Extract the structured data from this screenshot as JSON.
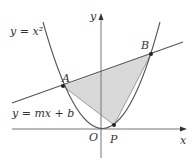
{
  "diagram": {
    "labels": {
      "parabola": "y = x²",
      "line": "y = mx + b",
      "point_a": "A",
      "point_b": "B",
      "point_p": "P",
      "origin": "O",
      "x_axis": "x",
      "y_axis": "y"
    },
    "colors": {
      "curve": "#555555",
      "axis": "#777777",
      "fill": "#d9d9d9",
      "text": "#333333",
      "point": "#222222"
    },
    "points": {
      "A": [
        63,
        86
      ],
      "B": [
        151,
        54
      ],
      "P": [
        114,
        125
      ]
    }
  }
}
